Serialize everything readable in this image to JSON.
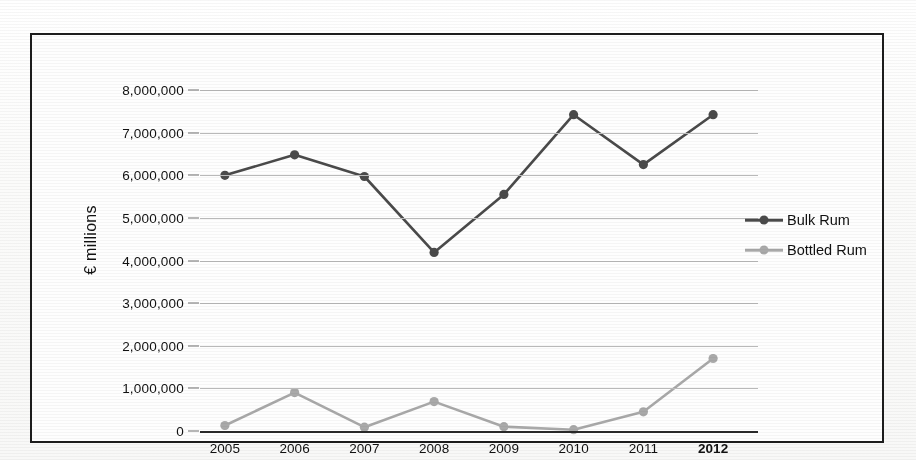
{
  "figure": {
    "frame_visible": true,
    "background_color": "#fefefe",
    "border_color": "#1d1d1d"
  },
  "axis": {
    "y_title": "€ millions",
    "y_ticks": [
      "8,000,000",
      "7,000,000",
      "6,000,000",
      "5,000,000",
      "4,000,000",
      "3,000,000",
      "2,000,000",
      "1,000,000",
      "0"
    ],
    "x_ticks": [
      "2005",
      "2006",
      "2007",
      "2008",
      "2009",
      "2010",
      "2011",
      "2012"
    ]
  },
  "legend": {
    "position": "right",
    "items": [
      {
        "label": "Bulk Rum",
        "color": "#4a4a4a"
      },
      {
        "label": "Bottled Rum",
        "color": "#a9a9a9"
      }
    ]
  },
  "chart_data": {
    "type": "line",
    "title": "",
    "subtitle": "",
    "xlabel": "",
    "ylabel": "€ millions",
    "x": [
      "2005",
      "2006",
      "2007",
      "2008",
      "2009",
      "2010",
      "2011",
      "2012"
    ],
    "ylim": [
      0,
      8000000
    ],
    "ytick_step": 1000000,
    "grid": true,
    "legend_position": "right",
    "series": [
      {
        "name": "Bulk Rum",
        "color": "#4a4a4a",
        "marker": "circle",
        "values": [
          6000000,
          6480000,
          5970000,
          4190000,
          5550000,
          7420000,
          6250000,
          7420000
        ]
      },
      {
        "name": "Bottled Rum",
        "color": "#a9a9a9",
        "marker": "circle",
        "values": [
          130000,
          900000,
          90000,
          690000,
          100000,
          30000,
          450000,
          1700000
        ]
      }
    ]
  }
}
